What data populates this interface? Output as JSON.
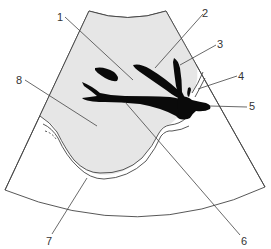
{
  "diagram": {
    "title": "",
    "type": "ultrasound sector schematic",
    "colors": {
      "background": "#ffffff",
      "tissue_fill": "#e6e6e6",
      "vessel_fill": "#0a0a0a",
      "outline": "#444444",
      "label_text": "#333333"
    },
    "labels": [
      {
        "id": "1",
        "text": "1",
        "x": 60,
        "y": 20
      },
      {
        "id": "2",
        "text": "2",
        "x": 202,
        "y": 17
      },
      {
        "id": "3",
        "text": "3",
        "x": 217,
        "y": 48
      },
      {
        "id": "4",
        "text": "4",
        "x": 238,
        "y": 79
      },
      {
        "id": "5",
        "text": "5",
        "x": 249,
        "y": 110
      },
      {
        "id": "6",
        "text": "6",
        "x": 241,
        "y": 242
      },
      {
        "id": "7",
        "text": "7",
        "x": 46,
        "y": 242
      },
      {
        "id": "8",
        "text": "8",
        "x": 17,
        "y": 84
      }
    ]
  }
}
